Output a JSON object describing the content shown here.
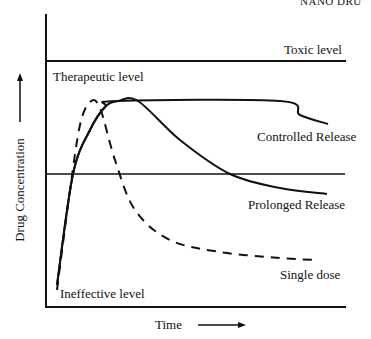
{
  "header": {
    "text": "NANO DRU"
  },
  "chart_data": {
    "type": "line",
    "title": "",
    "xlabel": "Time",
    "ylabel": "Drug Concentration",
    "grid": false,
    "reference_levels": [
      {
        "name": "Toxic level",
        "y_px": 61
      },
      {
        "name": "Therapeutic level",
        "y_px": 174
      },
      {
        "name": "Ineffective level",
        "y_px": 307
      }
    ],
    "series": [
      {
        "name": "Single dose",
        "style": "dashed",
        "points": [
          [
            57,
            290
          ],
          [
            70,
            190
          ],
          [
            80,
            125
          ],
          [
            90,
            102
          ],
          [
            100,
            108
          ],
          [
            115,
            160
          ],
          [
            135,
            210
          ],
          [
            170,
            240
          ],
          [
            220,
            252
          ],
          [
            280,
            258
          ],
          [
            315,
            260
          ]
        ]
      },
      {
        "name": "Controlled Release",
        "style": "solid",
        "points": [
          [
            57,
            285
          ],
          [
            73,
            174
          ],
          [
            90,
            130
          ],
          [
            105,
            107
          ],
          [
            118,
            101
          ],
          [
            280,
            101
          ],
          [
            300,
            115
          ],
          [
            328,
            124
          ]
        ]
      },
      {
        "name": "Prolonged Release",
        "style": "solid",
        "points": [
          [
            57,
            285
          ],
          [
            73,
            174
          ],
          [
            90,
            130
          ],
          [
            105,
            107
          ],
          [
            118,
            101
          ],
          [
            138,
            101
          ],
          [
            180,
            140
          ],
          [
            230,
            174
          ],
          [
            280,
            188
          ],
          [
            327,
            194
          ]
        ]
      }
    ]
  },
  "labels": {
    "toxic": "Toxic level",
    "therapeutic": "Therapeutic level",
    "controlled": "Controlled Release",
    "prolonged": "Prolonged Release",
    "single": "Single dose",
    "ineffective": "Ineffective level",
    "x_axis": "Time",
    "y_axis": "Drug Concentration"
  }
}
